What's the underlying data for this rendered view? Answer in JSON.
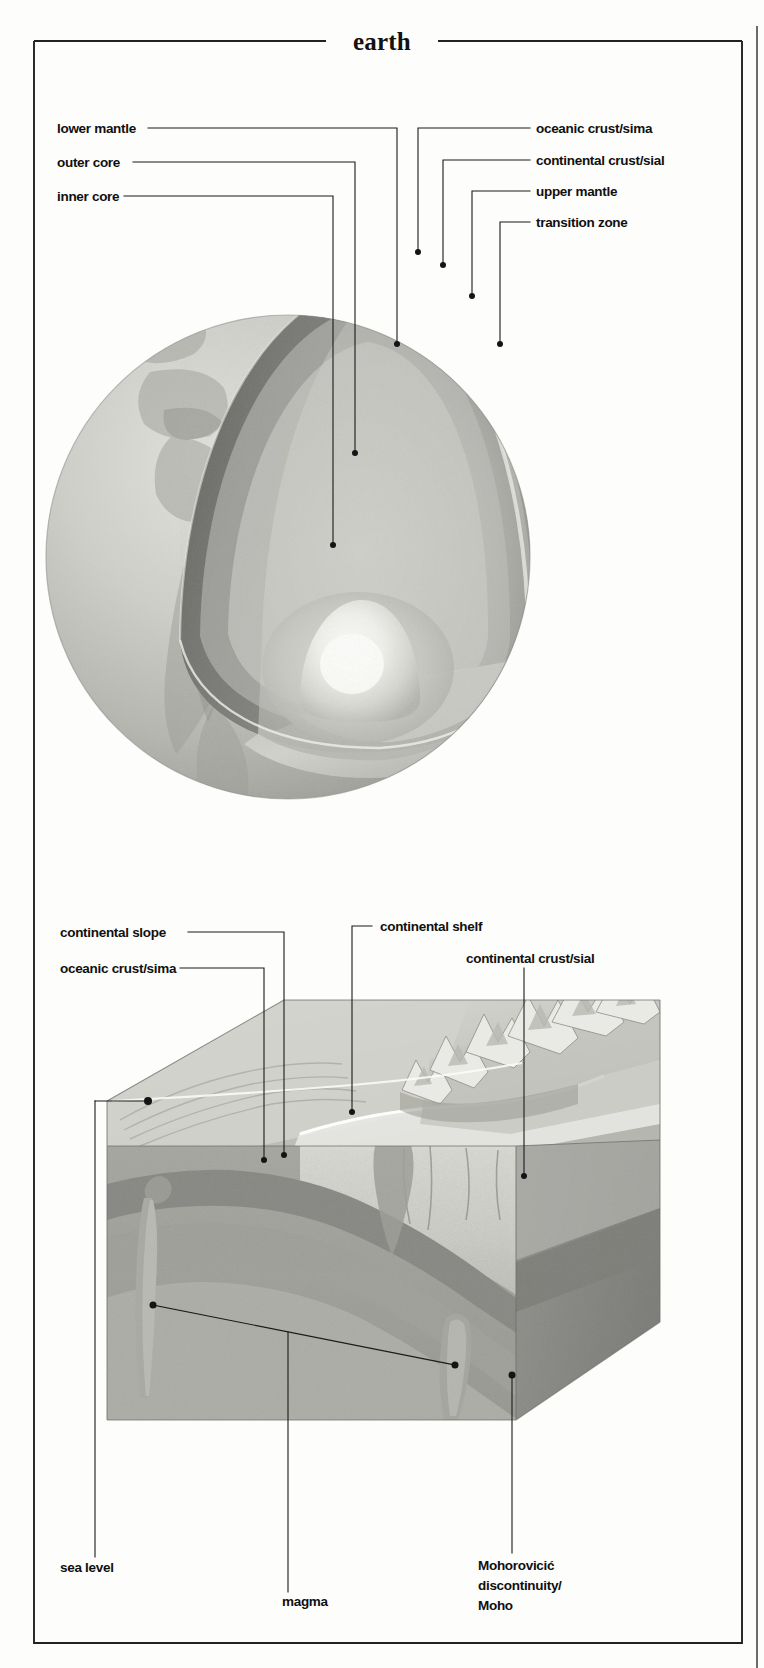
{
  "figure": {
    "title": "earth",
    "domain_type": "scientific-illustration",
    "panels": [
      {
        "id": "earth-cutaway",
        "caption": "cutaway globe showing internal layers",
        "labels_left": [
          {
            "key": "lower-mantle",
            "text": "lower mantle"
          },
          {
            "key": "outer-core",
            "text": "outer core"
          },
          {
            "key": "inner-core",
            "text": "inner core"
          }
        ],
        "labels_right": [
          {
            "key": "oceanic-crust-sima",
            "text": "oceanic crust/sima"
          },
          {
            "key": "continental-crust-sial",
            "text": "continental crust/sial"
          },
          {
            "key": "upper-mantle",
            "text": "upper mantle"
          },
          {
            "key": "transition-zone",
            "text": "transition zone"
          }
        ]
      },
      {
        "id": "crust-block",
        "caption": "block diagram of continental margin and crust",
        "labels_top": [
          {
            "key": "continental-slope",
            "text": "continental slope"
          },
          {
            "key": "oceanic-crust-sima-2",
            "text": "oceanic crust/sima"
          },
          {
            "key": "continental-shelf",
            "text": "continental shelf"
          },
          {
            "key": "continental-crust-sial-2",
            "text": "continental crust/sial"
          }
        ],
        "labels_bottom": [
          {
            "key": "sea-level",
            "text": "sea level"
          },
          {
            "key": "magma",
            "text": "magma"
          },
          {
            "key": "moho",
            "text": "Mohorovicić",
            "text2": "discontinuity/",
            "text3": "Moho"
          }
        ]
      }
    ]
  },
  "colors": {
    "ink": "#141414",
    "frame": "#222222",
    "paper": "#fdfdfc",
    "crust_dark": "#8e8e8e",
    "mantle_mid": "#a8a8a8",
    "mantle_light": "#c9c9c9",
    "core_bright": "#f2f2ee",
    "wedge_shadow": "#6f6f6f",
    "ocean_surface": "#b9b9b4",
    "block_front": "#9a9a98",
    "block_side": "#848482"
  }
}
